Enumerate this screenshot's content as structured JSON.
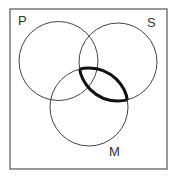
{
  "diagram": {
    "type": "venn",
    "frame": {
      "x": 10,
      "y": 9,
      "width": 157,
      "height": 160,
      "stroke": "#555555"
    },
    "circles": [
      {
        "id": "P",
        "label": "P",
        "cx": 58.5,
        "cy": 61,
        "r": 39.5,
        "label_x": 18,
        "label_y": 25
      },
      {
        "id": "S",
        "label": "S",
        "cx": 118,
        "cy": 62,
        "r": 39,
        "label_x": 147,
        "label_y": 27
      },
      {
        "id": "M",
        "label": "M",
        "cx": 89,
        "cy": 107,
        "r": 39,
        "label_x": 109,
        "label_y": 156
      }
    ],
    "highlight": {
      "description": "S ∩ M boundary outlined bold",
      "sets": [
        "S",
        "M"
      ],
      "stroke_width": 3
    }
  }
}
